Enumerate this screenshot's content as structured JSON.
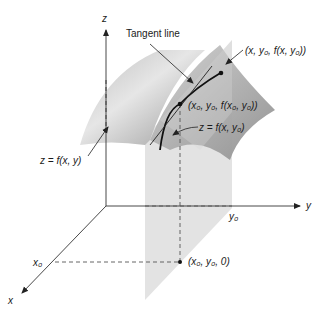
{
  "diagram": {
    "type": "3d-surface-partial-derivative",
    "axes": {
      "x": "x",
      "y": "y",
      "z": "z"
    },
    "labels": {
      "tangent_line": "Tangent line",
      "surface": "z = f(x, y)",
      "curve": "z = f(x, y₀)",
      "point_base": "(x₀, y₀, f(x₀, y₀))",
      "point_moving": "(x, y₀, f(x, y₀))",
      "point_ground": "(x₀, y₀, 0)",
      "x0": "x₀",
      "y0": "y₀"
    },
    "colors": {
      "surface": "#a9a9a9",
      "plane": "#dcdcdc",
      "axis": "#333333",
      "curve": "#111111"
    }
  }
}
